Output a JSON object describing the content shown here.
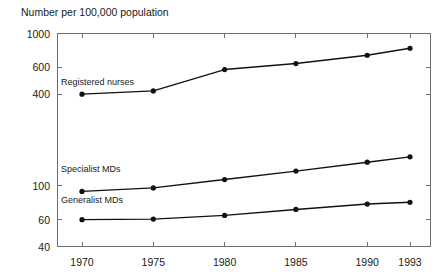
{
  "chart_data": {
    "type": "line",
    "title": "Number per 100,000 population",
    "xlabel": "",
    "ylabel": "",
    "yscale": "log",
    "ylim": [
      40,
      1000
    ],
    "grid": false,
    "legend_position": "inline-labels",
    "x": [
      1970,
      1975,
      1980,
      1985,
      1990,
      1993
    ],
    "categories": [
      "1970",
      "1975",
      "1980",
      "1985",
      "1990",
      "1993"
    ],
    "xtick_labels": [
      "1970",
      "1975",
      "1980",
      "1985",
      "1990",
      "1993"
    ],
    "ytick_labels": [
      "1000",
      "600",
      "400",
      "100",
      "60",
      "40"
    ],
    "ytick_values": [
      1000,
      600,
      400,
      100,
      60,
      40
    ],
    "series": [
      {
        "name": "Registered nurses",
        "values": [
          400,
          420,
          580,
          635,
          720,
          800
        ],
        "label_x": 1970,
        "label_y": 470
      },
      {
        "name": "Specialist MDs",
        "values": [
          92,
          97,
          110,
          125,
          143,
          155
        ],
        "label_x": 1970,
        "label_y": 128
      },
      {
        "name": "Generalist MDs",
        "values": [
          60,
          60.5,
          64,
          70,
          76,
          78
        ],
        "label_x": 1970,
        "label_y": 80
      }
    ],
    "colors": {
      "line": "#111111",
      "marker": "#111111",
      "axis": "#6e6e6e",
      "text": "#1a1a1a",
      "background": "#ffffff"
    }
  }
}
